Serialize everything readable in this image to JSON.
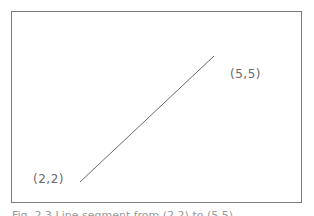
{
  "diagram": {
    "points": [
      {
        "label": "(2,2)",
        "x": 2,
        "y": 2
      },
      {
        "label": "(5,5)",
        "x": 5,
        "y": 5
      }
    ],
    "line_color": "#6a6a6a",
    "frame_color": "#7a7a7a"
  },
  "caption": "Fig. 2.3  Line segment from (2,2) to (5,5)"
}
